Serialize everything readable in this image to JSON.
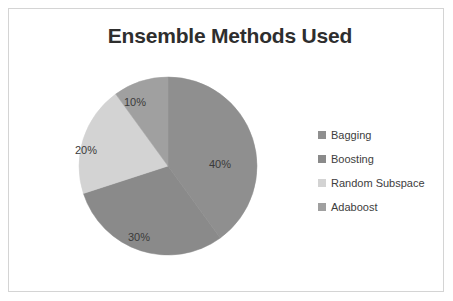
{
  "chart_data": {
    "type": "pie",
    "title": "Ensemble Methods Used",
    "categories": [
      "Bagging",
      "Boosting",
      "Random Subspace",
      "Adaboost"
    ],
    "values": [
      40,
      30,
      20,
      10
    ],
    "value_labels": [
      "40%",
      "30%",
      "20%",
      "10%"
    ],
    "colors": [
      "#8f8f8f",
      "#8a8a8a",
      "#d3d3d3",
      "#a0a0a0"
    ],
    "units": "percent",
    "legend_position": "right",
    "grid": false,
    "xlabel": "",
    "ylabel": "",
    "start_angle_deg": 0,
    "direction": "clockwise"
  },
  "frame": {
    "background_color": "#ffffff",
    "border_color": "#d4d4d4"
  },
  "title": {
    "text": "Ensemble Methods Used",
    "color": "#2e2e2e"
  },
  "pie": {
    "slices": [
      {
        "label": "Bagging",
        "percent_label": "40%",
        "value": 40,
        "color": "#8f8f8f"
      },
      {
        "label": "Boosting",
        "percent_label": "30%",
        "value": 30,
        "color": "#8a8a8a"
      },
      {
        "label": "Random Subspace",
        "percent_label": "20%",
        "value": 20,
        "color": "#d3d3d3"
      },
      {
        "label": "Adaboost",
        "percent_label": "10%",
        "value": 10,
        "color": "#a0a0a0"
      }
    ]
  },
  "legend": {
    "items": [
      {
        "label": "Bagging",
        "color": "#8f8f8f"
      },
      {
        "label": "Boosting",
        "color": "#8a8a8a"
      },
      {
        "label": "Random Subspace",
        "color": "#d3d3d3"
      },
      {
        "label": "Adaboost",
        "color": "#a0a0a0"
      }
    ]
  }
}
